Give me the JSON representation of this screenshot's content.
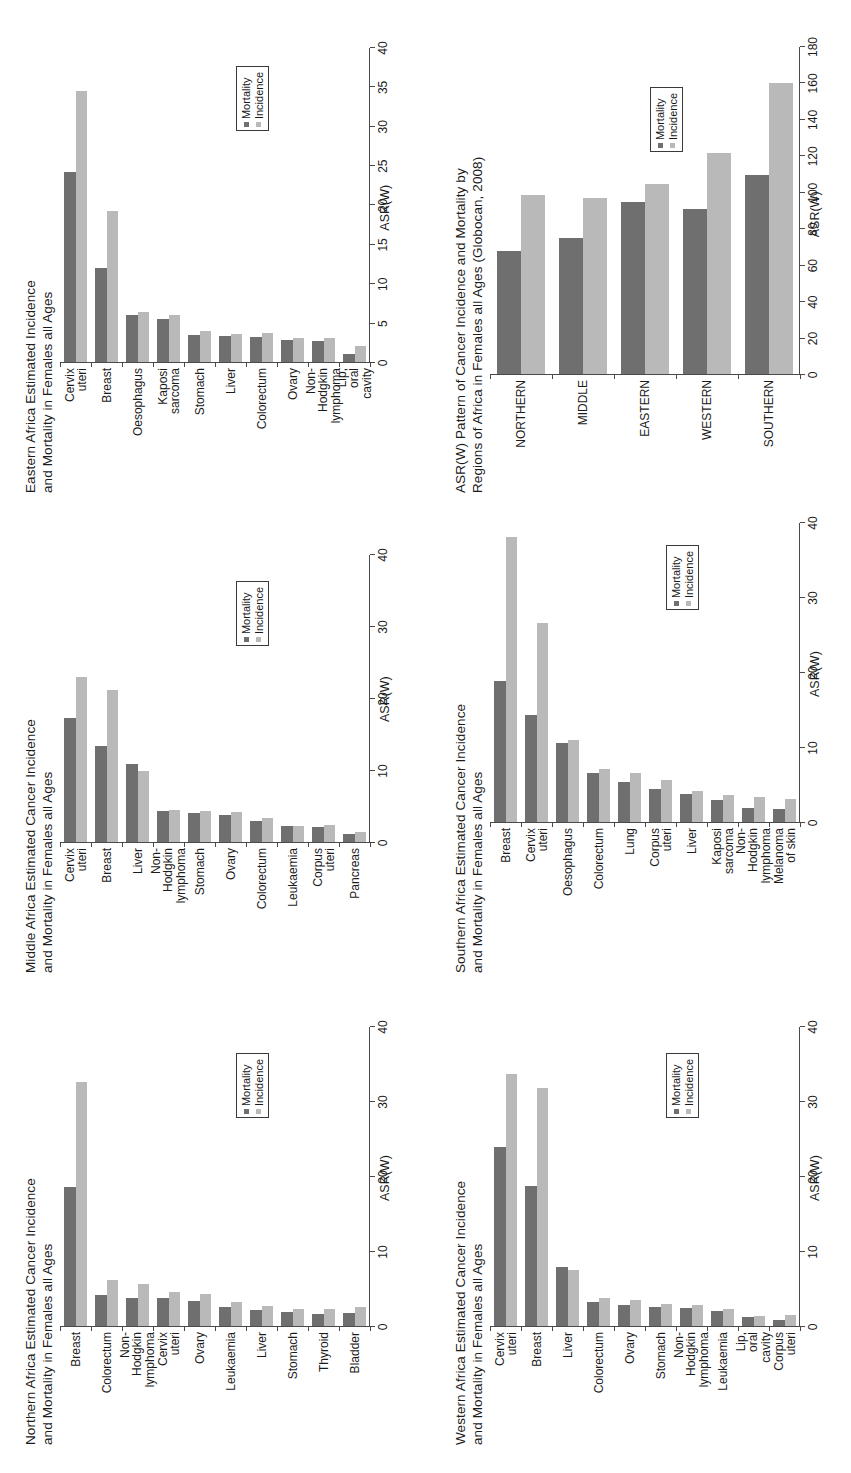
{
  "figure": {
    "colors": {
      "mortality": "#6f6f6f",
      "incidence": "#b9b9b9",
      "axis": "#4a4a4a",
      "text": "#1b1b1b"
    },
    "legend": {
      "mortality": "Mortality",
      "incidence": "Incidence"
    },
    "axis_title": "ASR(W)"
  },
  "chart_data": [
    {
      "id": "northern",
      "type": "bar",
      "orientation": "horizontal",
      "title": "Northern Africa Estimated Cancer Incidence\nand Mortality in Females all Ages",
      "xlabel": "ASR(W)",
      "ylabel": "",
      "xlim": [
        0,
        40
      ],
      "xticks": [
        0,
        10,
        20,
        30,
        40
      ],
      "grid": false,
      "legend_position": "inside-right",
      "categories": [
        "Breast",
        "Colorectum",
        "Non-Hodgkin\nlymphoma",
        "Cervix uteri",
        "Ovary",
        "Leukaemia",
        "Liver",
        "Stomach",
        "Thyroid",
        "Bladder"
      ],
      "series": [
        {
          "name": "Mortality",
          "values": [
            18.6,
            4.2,
            3.8,
            3.8,
            3.4,
            2.7,
            2.2,
            2.0,
            1.7,
            1.8
          ]
        },
        {
          "name": "Incidence",
          "values": [
            32.7,
            6.2,
            5.7,
            4.7,
            4.4,
            3.3,
            2.8,
            2.4,
            2.4,
            2.6
          ]
        }
      ]
    },
    {
      "id": "middle",
      "type": "bar",
      "orientation": "horizontal",
      "title": "Middle Africa Estimated Cancer Incidence\nand Mortality in Females all Ages",
      "xlabel": "ASR(W)",
      "ylabel": "",
      "xlim": [
        0,
        40
      ],
      "xticks": [
        0,
        10,
        20,
        30,
        40
      ],
      "grid": false,
      "legend_position": "inside-right",
      "categories": [
        "Cervix uteri",
        "Breast",
        "Liver",
        "Non-Hodgkin\nlymphoma",
        "Stomach",
        "Ovary",
        "Colorectum",
        "Leukaemia",
        "Corpus uteri",
        "Pancreas"
      ],
      "series": [
        {
          "name": "Mortality",
          "values": [
            17.4,
            13.5,
            11.0,
            4.4,
            4.1,
            3.9,
            3.1,
            2.3,
            2.2,
            1.2
          ]
        },
        {
          "name": "Incidence",
          "values": [
            23.0,
            21.3,
            10.0,
            4.6,
            4.4,
            4.3,
            3.5,
            2.4,
            2.5,
            1.5
          ]
        }
      ]
    },
    {
      "id": "eastern",
      "type": "bar",
      "orientation": "horizontal",
      "title": "Eastern Africa Estimated Incidence\nand Mortality in Females all Ages",
      "xlabel": "ASR(W)",
      "ylabel": "",
      "xlim": [
        0,
        40
      ],
      "xticks": [
        0,
        5,
        10,
        15,
        20,
        25,
        30,
        35,
        40
      ],
      "grid": false,
      "legend_position": "inside-right",
      "categories": [
        "Cervix uteri",
        "Breast",
        "Oesophagus",
        "Kaposi sarcoma",
        "Stomach",
        "Liver",
        "Colorectum",
        "Ovary",
        "Non-Hodgkin\nlymphoma",
        "Lip, oral cavity"
      ],
      "series": [
        {
          "name": "Mortality",
          "values": [
            24.2,
            12.0,
            6.1,
            5.6,
            3.6,
            3.4,
            3.3,
            2.9,
            2.8,
            1.1
          ]
        },
        {
          "name": "Incidence",
          "values": [
            34.5,
            19.3,
            6.5,
            6.1,
            4.1,
            3.7,
            3.8,
            3.2,
            3.2,
            2.1
          ]
        }
      ]
    },
    {
      "id": "western",
      "type": "bar",
      "orientation": "horizontal",
      "title": "Western Africa Estimated Cancer Incidence\nand Mortality in Females all Ages",
      "xlabel": "ASR(W)",
      "ylabel": "",
      "xlim": [
        0,
        40
      ],
      "xticks": [
        0,
        10,
        20,
        30,
        40
      ],
      "grid": false,
      "legend_position": "inside-right",
      "categories": [
        "Cervix uteri",
        "Breast",
        "Liver",
        "Colorectum",
        "Ovary",
        "Stomach",
        "Non-Hodgkin\nlymphoma",
        "Leukaemia",
        "Lip, oral cavity",
        "Corpus uteri"
      ],
      "series": [
        {
          "name": "Mortality",
          "values": [
            24.0,
            18.8,
            8.0,
            3.3,
            2.9,
            2.7,
            2.5,
            2.1,
            1.3,
            0.9
          ]
        },
        {
          "name": "Incidence",
          "values": [
            33.7,
            31.8,
            7.6,
            3.9,
            3.6,
            3.0,
            2.9,
            2.4,
            1.5,
            1.6
          ]
        }
      ]
    },
    {
      "id": "southern",
      "type": "bar",
      "orientation": "horizontal",
      "title": "Southern Africa Estimated Cancer Incidence\nand Mortality in Females all Ages",
      "xlabel": "ASR(W)",
      "ylabel": "",
      "xlim": [
        0,
        40
      ],
      "xticks": [
        0,
        10,
        20,
        30,
        40
      ],
      "grid": false,
      "legend_position": "inside-right",
      "categories": [
        "Breast",
        "Cervix uteri",
        "Oesophagus",
        "Colorectum",
        "Lung",
        "Corpus uteri",
        "Liver",
        "Kaposi sarcoma",
        "Non-Hodgkin\nlymphoma",
        "Melanoma of skin"
      ],
      "series": [
        {
          "name": "Mortality",
          "values": [
            18.9,
            14.4,
            10.6,
            6.7,
            5.5,
            4.5,
            3.9,
            3.0,
            2.0,
            1.8
          ]
        },
        {
          "name": "Incidence",
          "values": [
            38.1,
            26.7,
            11.1,
            7.2,
            6.6,
            5.7,
            4.2,
            3.7,
            3.4,
            3.2
          ]
        }
      ]
    },
    {
      "id": "regions",
      "type": "bar",
      "orientation": "horizontal",
      "title": "ASR(W) Pattern of Cancer Incidence and Mortality by\nRegions of Africa in Females all Ages (Globocan, 2008)",
      "xlabel": "ASR(W)",
      "ylabel": "",
      "xlim": [
        0,
        180
      ],
      "xticks": [
        0,
        20,
        40,
        60,
        80,
        100,
        120,
        140,
        160,
        180
      ],
      "grid": false,
      "legend_position": "inside-right",
      "categories": [
        "NORTHERN",
        "MIDDLE",
        "EASTERN",
        "WESTERN",
        "SOUTHERN"
      ],
      "series": [
        {
          "name": "Mortality",
          "values": [
            68.0,
            75.0,
            95.0,
            91.0,
            110.0
          ]
        },
        {
          "name": "Incidence",
          "values": [
            99.0,
            97.0,
            105.0,
            122.0,
            160.0
          ]
        }
      ]
    }
  ]
}
